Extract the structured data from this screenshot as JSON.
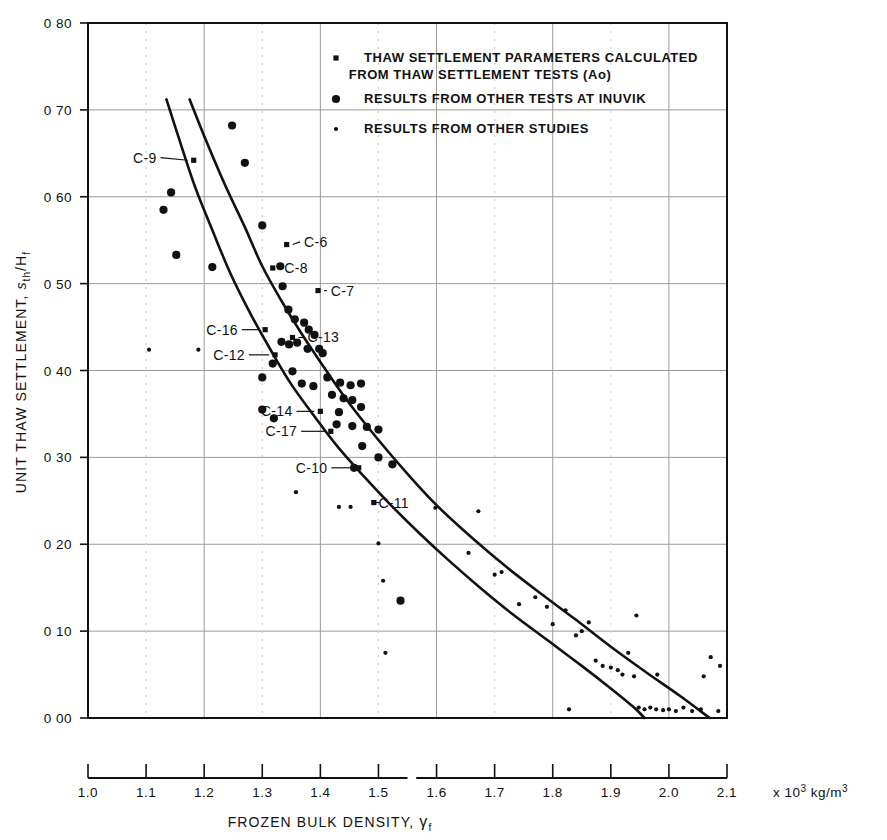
{
  "figure": {
    "title": "",
    "y_axis_title_main": "UNIT THAW SETTLEMENT,",
    "y_axis_title_sym": "s",
    "y_axis_title_sym_sub": "th",
    "y_axis_title_sym_den": "/H",
    "y_axis_title_sym_den_sub": "f",
    "x_axis_title_main": "FROZEN BULK DENSITY,",
    "x_axis_title_sym": "γ",
    "x_axis_title_sym_sub": "f",
    "x_axis_units_prefix": "x 10",
    "x_axis_units_exp": "3",
    "x_axis_units_suffix": " kg/m",
    "x_axis_units_suffix_exp": "3"
  },
  "legend": {
    "entries": [
      {
        "marker": "cross-small-square",
        "line1": "THAW SETTLEMENT PARAMETERS CALCULATED",
        "line2": "FROM THAW SETTLEMENT TESTS  (Ao)"
      },
      {
        "marker": "filled-circle-large",
        "line1": "RESULTS FROM OTHER TESTS AT INUVIK",
        "line2": ""
      },
      {
        "marker": "filled-dot-small",
        "line1": "RESULTS FROM OTHER STUDIES",
        "line2": ""
      }
    ]
  },
  "chart_data": {
    "type": "scatter",
    "title": "",
    "xlabel": "FROZEN BULK DENSITY, γf  (x 10^3 kg/m^3)",
    "ylabel": "UNIT THAW SETTLEMENT, s_th/H_f",
    "xlim": [
      1.0,
      2.1
    ],
    "ylim": [
      0.0,
      0.8
    ],
    "xticks": [
      "1.0",
      "1.1",
      "1.2",
      "1.3",
      "1.4",
      "1.5",
      "1.6",
      "1.7",
      "1.8",
      "1.9",
      "2.0",
      "2.1"
    ],
    "xtick_values": [
      1.0,
      1.1,
      1.2,
      1.3,
      1.4,
      1.5,
      1.6,
      1.7,
      1.8,
      1.9,
      2.0,
      2.1
    ],
    "yticks": [
      "0 80",
      "0 70",
      "0 60",
      "0 50",
      "0 40",
      "0 30",
      "0 20",
      "0 10",
      "0 00"
    ],
    "ytick_values": [
      0.8,
      0.7,
      0.6,
      0.5,
      0.4,
      0.3,
      0.2,
      0.1,
      0.0
    ],
    "grid": true,
    "grid_x_values": [
      1.2,
      1.4,
      1.6,
      1.8,
      2.0
    ],
    "grid_y_values": [
      0.1,
      0.2,
      0.3,
      0.4,
      0.5,
      0.6,
      0.7
    ],
    "legend_position": "top-right-inside",
    "series": [
      {
        "name": "RESULTS FROM OTHER TESTS AT INUVIK",
        "marker": "filled-circle-large",
        "points": [
          [
            1.143,
            0.605
          ],
          [
            1.13,
            0.585
          ],
          [
            1.248,
            0.682
          ],
          [
            1.27,
            0.639
          ],
          [
            1.152,
            0.533
          ],
          [
            1.214,
            0.519
          ],
          [
            1.3,
            0.567
          ],
          [
            1.331,
            0.52
          ],
          [
            1.335,
            0.497
          ],
          [
            1.345,
            0.47
          ],
          [
            1.356,
            0.459
          ],
          [
            1.372,
            0.455
          ],
          [
            1.38,
            0.447
          ],
          [
            1.39,
            0.441
          ],
          [
            1.333,
            0.433
          ],
          [
            1.346,
            0.43
          ],
          [
            1.36,
            0.432
          ],
          [
            1.378,
            0.425
          ],
          [
            1.398,
            0.425
          ],
          [
            1.3,
            0.392
          ],
          [
            1.318,
            0.408
          ],
          [
            1.352,
            0.399
          ],
          [
            1.404,
            0.42
          ],
          [
            1.368,
            0.385
          ],
          [
            1.388,
            0.382
          ],
          [
            1.3,
            0.355
          ],
          [
            1.32,
            0.345
          ],
          [
            1.412,
            0.392
          ],
          [
            1.434,
            0.386
          ],
          [
            1.452,
            0.383
          ],
          [
            1.47,
            0.385
          ],
          [
            1.42,
            0.372
          ],
          [
            1.44,
            0.368
          ],
          [
            1.455,
            0.366
          ],
          [
            1.47,
            0.358
          ],
          [
            1.432,
            0.352
          ],
          [
            1.428,
            0.338
          ],
          [
            1.455,
            0.336
          ],
          [
            1.48,
            0.335
          ],
          [
            1.5,
            0.332
          ],
          [
            1.472,
            0.313
          ],
          [
            1.5,
            0.3
          ],
          [
            1.524,
            0.292
          ],
          [
            1.538,
            0.135
          ],
          [
            1.458,
            0.288
          ]
        ]
      },
      {
        "name": "THAW SETTLEMENT PARAMETERS CALCULATED FROM THAW SETTLEMENT TESTS (Ao)",
        "marker": "cross-small-square",
        "points": [
          [
            1.182,
            0.642
          ],
          [
            1.342,
            0.545
          ],
          [
            1.318,
            0.518
          ],
          [
            1.396,
            0.492
          ],
          [
            1.305,
            0.447
          ],
          [
            1.352,
            0.438
          ],
          [
            1.322,
            0.418
          ],
          [
            1.4,
            0.353
          ],
          [
            1.418,
            0.33
          ],
          [
            1.466,
            0.288
          ],
          [
            1.492,
            0.248
          ]
        ]
      },
      {
        "name": "RESULTS FROM OTHER STUDIES",
        "marker": "filled-dot-small",
        "points": [
          [
            1.105,
            0.424
          ],
          [
            1.19,
            0.424
          ],
          [
            1.358,
            0.26
          ],
          [
            1.432,
            0.243
          ],
          [
            1.452,
            0.243
          ],
          [
            1.5,
            0.201
          ],
          [
            1.508,
            0.158
          ],
          [
            1.512,
            0.075
          ],
          [
            1.598,
            0.242
          ],
          [
            1.655,
            0.19
          ],
          [
            1.672,
            0.238
          ],
          [
            1.7,
            0.165
          ],
          [
            1.712,
            0.168
          ],
          [
            1.742,
            0.131
          ],
          [
            1.77,
            0.139
          ],
          [
            1.79,
            0.128
          ],
          [
            1.8,
            0.108
          ],
          [
            1.822,
            0.124
          ],
          [
            1.84,
            0.095
          ],
          [
            1.85,
            0.1
          ],
          [
            1.862,
            0.11
          ],
          [
            1.874,
            0.066
          ],
          [
            1.886,
            0.06
          ],
          [
            1.9,
            0.058
          ],
          [
            1.912,
            0.055
          ],
          [
            1.92,
            0.05
          ],
          [
            1.93,
            0.075
          ],
          [
            1.94,
            0.048
          ],
          [
            1.948,
            0.012
          ],
          [
            1.958,
            0.01
          ],
          [
            1.968,
            0.012
          ],
          [
            1.978,
            0.01
          ],
          [
            1.99,
            0.009
          ],
          [
            2.0,
            0.01
          ],
          [
            2.012,
            0.008
          ],
          [
            2.025,
            0.012
          ],
          [
            2.04,
            0.008
          ],
          [
            2.055,
            0.01
          ],
          [
            2.072,
            0.07
          ],
          [
            2.085,
            0.008
          ],
          [
            1.944,
            0.118
          ],
          [
            1.828,
            0.01
          ],
          [
            2.088,
            0.06
          ],
          [
            1.98,
            0.05
          ],
          [
            2.06,
            0.048
          ]
        ]
      }
    ],
    "curves": [
      {
        "name": "upper-envelope",
        "style": "solid",
        "points": [
          [
            1.175,
            0.712
          ],
          [
            1.2,
            0.67
          ],
          [
            1.235,
            0.615
          ],
          [
            1.27,
            0.565
          ],
          [
            1.3,
            0.52
          ],
          [
            1.335,
            0.478
          ],
          [
            1.37,
            0.44
          ],
          [
            1.41,
            0.4
          ],
          [
            1.45,
            0.362
          ],
          [
            1.5,
            0.32
          ],
          [
            1.55,
            0.281
          ],
          [
            1.6,
            0.245
          ],
          [
            1.66,
            0.208
          ],
          [
            1.72,
            0.174
          ],
          [
            1.78,
            0.143
          ],
          [
            1.84,
            0.113
          ],
          [
            1.9,
            0.082
          ],
          [
            1.96,
            0.053
          ],
          [
            2.02,
            0.025
          ],
          [
            2.07,
            0.0
          ]
        ]
      },
      {
        "name": "lower-envelope",
        "style": "solid",
        "points": [
          [
            1.135,
            0.712
          ],
          [
            1.16,
            0.66
          ],
          [
            1.185,
            0.61
          ],
          [
            1.215,
            0.56
          ],
          [
            1.245,
            0.512
          ],
          [
            1.28,
            0.465
          ],
          [
            1.315,
            0.423
          ],
          [
            1.35,
            0.384
          ],
          [
            1.39,
            0.347
          ],
          [
            1.43,
            0.312
          ],
          [
            1.475,
            0.278
          ],
          [
            1.52,
            0.246
          ],
          [
            1.57,
            0.213
          ],
          [
            1.62,
            0.182
          ],
          [
            1.675,
            0.15
          ],
          [
            1.73,
            0.12
          ],
          [
            1.79,
            0.09
          ],
          [
            1.85,
            0.06
          ],
          [
            1.9,
            0.034
          ],
          [
            1.94,
            0.012
          ],
          [
            1.958,
            0.0
          ]
        ]
      }
    ],
    "annotations": [
      {
        "label": "C-9",
        "text_x": 1.118,
        "text_y": 0.645,
        "leader_to_x": 1.182,
        "leader_to_y": 0.642
      },
      {
        "label": "C-6",
        "text_x": 1.372,
        "text_y": 0.548,
        "leader_to_x": 1.342,
        "leader_to_y": 0.545
      },
      {
        "label": "C-8",
        "text_x": 1.338,
        "text_y": 0.518,
        "leader_to_x": 1.318,
        "leader_to_y": 0.518
      },
      {
        "label": "C-7",
        "text_x": 1.418,
        "text_y": 0.492,
        "leader_to_x": 1.396,
        "leader_to_y": 0.492
      },
      {
        "label": "C-16",
        "text_x": 1.258,
        "text_y": 0.447,
        "leader_to_x": 1.305,
        "leader_to_y": 0.447
      },
      {
        "label": "C-13",
        "text_x": 1.378,
        "text_y": 0.438,
        "leader_to_x": 1.352,
        "leader_to_y": 0.438
      },
      {
        "label": "C-12",
        "text_x": 1.27,
        "text_y": 0.418,
        "leader_to_x": 1.322,
        "leader_to_y": 0.418
      },
      {
        "label": "C-14",
        "text_x": 1.352,
        "text_y": 0.353,
        "leader_to_x": 1.4,
        "leader_to_y": 0.353
      },
      {
        "label": "C-17",
        "text_x": 1.36,
        "text_y": 0.33,
        "leader_to_x": 1.418,
        "leader_to_y": 0.33
      },
      {
        "label": "C-10",
        "text_x": 1.412,
        "text_y": 0.288,
        "leader_to_x": 1.466,
        "leader_to_y": 0.288
      },
      {
        "label": "C-11",
        "text_x": 1.5,
        "text_y": 0.248,
        "leader_to_x": 1.492,
        "leader_to_y": 0.248
      }
    ],
    "colors": {
      "ink": "#111111",
      "grid": "#9a9a9a",
      "axis": "#111111",
      "background": "#ffffff"
    }
  }
}
